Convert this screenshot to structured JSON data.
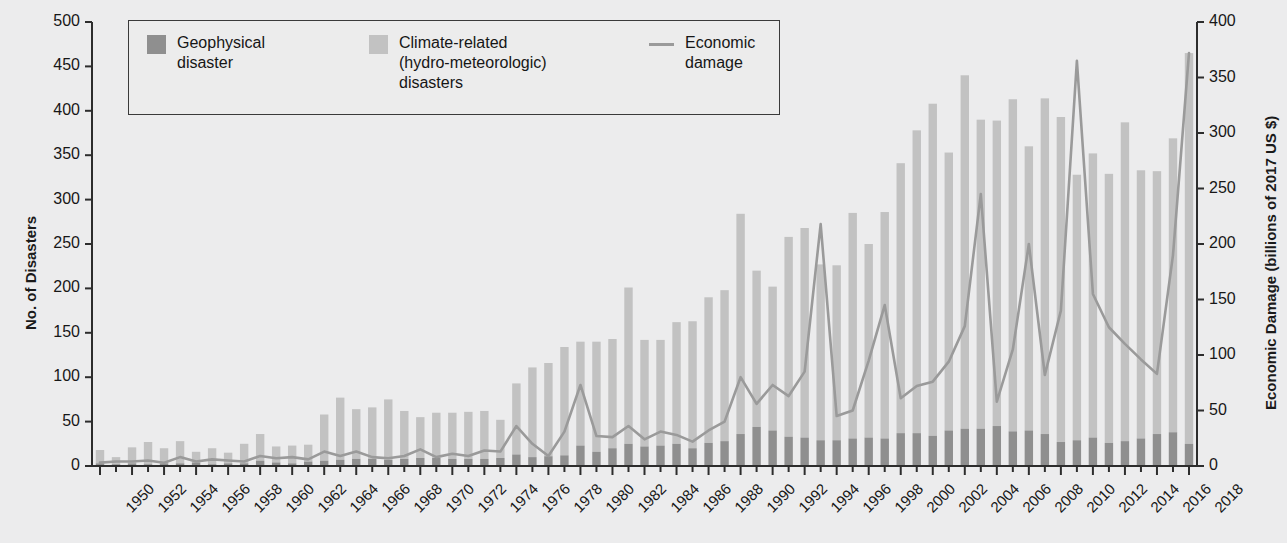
{
  "chart_data": {
    "type": "bar",
    "title": "",
    "subtitle": "",
    "xlabel": "",
    "ylabel": "No. of Disasters",
    "y2label": "Economic Damage (billions of 2017 US $)",
    "ylim": [
      0,
      500
    ],
    "y2lim": [
      0,
      400
    ],
    "yticks": [
      0,
      50,
      100,
      150,
      200,
      250,
      300,
      350,
      400,
      450,
      500
    ],
    "y2ticks": [
      0,
      50,
      100,
      150,
      200,
      250,
      300,
      350,
      400
    ],
    "xlim": [
      1950,
      2018
    ],
    "xticks": [
      1950,
      1952,
      1954,
      1956,
      1958,
      1960,
      1962,
      1964,
      1966,
      1968,
      1970,
      1972,
      1974,
      1976,
      1978,
      1980,
      1982,
      1984,
      1986,
      1988,
      1990,
      1992,
      1994,
      1996,
      1998,
      2000,
      2002,
      2004,
      2006,
      2008,
      2010,
      2012,
      2014,
      2016,
      2018
    ],
    "xtick_minor_every": 1,
    "grid": false,
    "legend_position": "top-left-inside",
    "stacked": true,
    "x": [
      1950,
      1951,
      1952,
      1953,
      1954,
      1955,
      1956,
      1957,
      1958,
      1959,
      1960,
      1961,
      1962,
      1963,
      1964,
      1965,
      1966,
      1967,
      1968,
      1969,
      1970,
      1971,
      1972,
      1973,
      1974,
      1975,
      1976,
      1977,
      1978,
      1979,
      1980,
      1981,
      1982,
      1983,
      1984,
      1985,
      1986,
      1987,
      1988,
      1989,
      1990,
      1991,
      1992,
      1993,
      1994,
      1995,
      1996,
      1997,
      1998,
      1999,
      2000,
      2001,
      2002,
      2003,
      2004,
      2005,
      2006,
      2007,
      2008,
      2009,
      2010,
      2011,
      2012,
      2013,
      2014,
      2015,
      2016,
      2017,
      2018
    ],
    "series": [
      {
        "name": "Geophysical disaster",
        "color": "#8f8f8f",
        "values": [
          3,
          2,
          3,
          2,
          3,
          3,
          4,
          2,
          3,
          3,
          6,
          4,
          3,
          5,
          6,
          7,
          8,
          8,
          7,
          8,
          9,
          9,
          8,
          8,
          8,
          9,
          13,
          10,
          11,
          12,
          23,
          16,
          20,
          25,
          22,
          23,
          25,
          20,
          26,
          28,
          36,
          44,
          40,
          33,
          32,
          29,
          29,
          31,
          32,
          31,
          37,
          37,
          34,
          40,
          42,
          42,
          45,
          39,
          40,
          36,
          27,
          29,
          32,
          26,
          28,
          31,
          36,
          38,
          25
        ]
      },
      {
        "name": "Climate-related (hydro-meteorologic) disasters",
        "color": "#c2c2c2",
        "values": [
          15,
          8,
          18,
          25,
          17,
          25,
          12,
          18,
          12,
          22,
          30,
          18,
          20,
          19,
          52,
          70,
          56,
          58,
          68,
          54,
          46,
          51,
          52,
          53,
          54,
          43,
          80,
          101,
          105,
          122,
          117,
          124,
          123,
          176,
          120,
          119,
          137,
          143,
          164,
          170,
          248,
          176,
          162,
          225,
          236,
          198,
          197,
          254,
          218,
          255,
          304,
          341,
          374,
          313,
          398,
          348,
          344,
          374,
          320,
          378,
          366,
          299,
          320,
          303,
          359,
          302,
          296,
          331,
          440
        ]
      }
    ],
    "line": {
      "name": "Economic damage",
      "color": "#9a9a9a",
      "axis": "right",
      "unit": "billions of 2017 US $",
      "values": [
        3,
        4,
        4,
        5,
        3,
        8,
        4,
        6,
        5,
        4,
        9,
        7,
        8,
        6,
        13,
        9,
        13,
        8,
        7,
        9,
        15,
        8,
        11,
        9,
        14,
        13,
        36,
        20,
        9,
        31,
        73,
        27,
        26,
        36,
        24,
        31,
        28,
        22,
        32,
        40,
        80,
        56,
        73,
        63,
        85,
        218,
        45,
        50,
        95,
        145,
        61,
        72,
        76,
        94,
        126,
        245,
        58,
        105,
        200,
        82,
        140,
        365,
        155,
        125,
        110,
        96,
        83,
        190,
        372
      ]
    }
  },
  "legend": {
    "items": [
      {
        "marker": "swatch",
        "name": "geophysical-swatch",
        "lines": [
          "Geophysical",
          "disaster"
        ]
      },
      {
        "marker": "swatch",
        "name": "climate-swatch",
        "lines": [
          "Climate-related",
          "(hydro-meteorologic)",
          "disasters"
        ]
      },
      {
        "marker": "line",
        "name": "economic-line-marker",
        "lines": [
          "Economic",
          "damage"
        ]
      }
    ]
  },
  "colors": {
    "background": "#ececed",
    "geophysical": "#8f8f8f",
    "climate": "#c2c2c2",
    "economic_line": "#9a9a9a",
    "axis": "#2d2d2d",
    "text": "#171717"
  }
}
